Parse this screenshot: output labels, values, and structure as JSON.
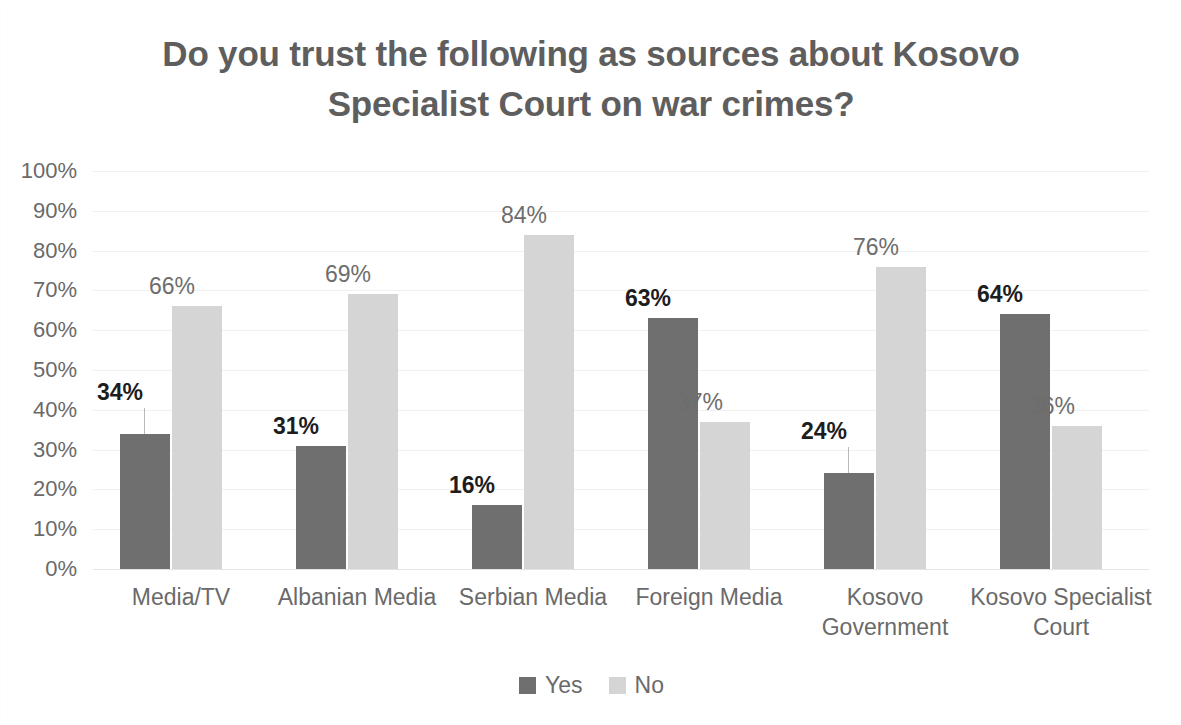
{
  "chart_data": {
    "type": "bar",
    "title": "Do you trust the following as sources about Kosovo Specialist Court on war crimes?",
    "title_line1": "Do you trust the following as sources about Kosovo",
    "title_line2": "Specialist Court on war crimes?",
    "xlabel": "",
    "ylabel": "",
    "ylim": [
      0,
      100
    ],
    "ytick_labels": [
      "100%",
      "90%",
      "80%",
      "70%",
      "60%",
      "50%",
      "40%",
      "30%",
      "20%",
      "10%",
      "0%"
    ],
    "ytick_values": [
      100,
      90,
      80,
      70,
      60,
      50,
      40,
      30,
      20,
      10,
      0
    ],
    "grid": true,
    "legend_position": "bottom-center",
    "categories": [
      "Media/TV",
      "Albanian Media",
      "Serbian Media",
      "Foreign Media",
      "Kosovo Government",
      "Kosovo Specialist Court"
    ],
    "category_lines": [
      [
        "Media/TV"
      ],
      [
        "Albanian Media"
      ],
      [
        "Serbian Media"
      ],
      [
        "Foreign Media"
      ],
      [
        "Kosovo",
        "Government"
      ],
      [
        "Kosovo Specialist",
        "Court"
      ]
    ],
    "series": [
      {
        "name": "Yes",
        "color": "#6f6f6f",
        "values": [
          34,
          31,
          16,
          63,
          24,
          64
        ],
        "labels": [
          "34%",
          "31%",
          "16%",
          "63%",
          "24%",
          "64%"
        ]
      },
      {
        "name": "No",
        "color": "#d5d5d5",
        "values": [
          66,
          69,
          84,
          37,
          76,
          36
        ],
        "labels": [
          "66%",
          "69%",
          "84%",
          "37%",
          "76%",
          "36%"
        ]
      }
    ],
    "legend": [
      {
        "label": "Yes",
        "color": "#6f6f6f"
      },
      {
        "label": "No",
        "color": "#d5d5d5"
      }
    ]
  }
}
